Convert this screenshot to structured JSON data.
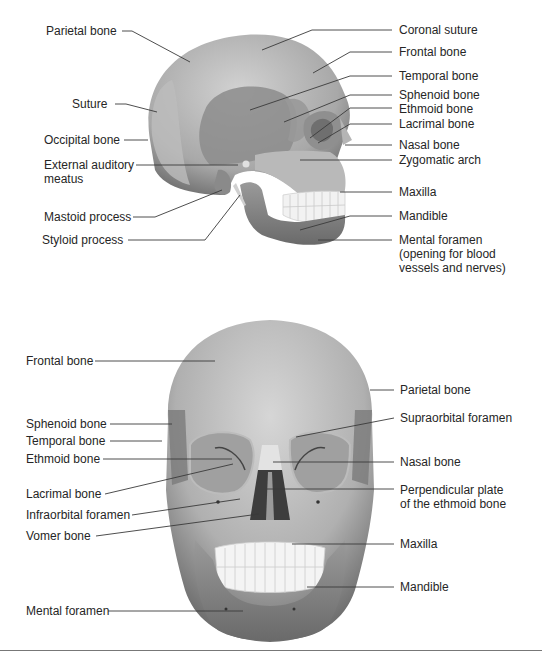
{
  "figure": {
    "lateral_view": {
      "left_labels": [
        {
          "id": "parietal",
          "text": "Parietal bone"
        },
        {
          "id": "suture",
          "text": "Suture"
        },
        {
          "id": "occipital",
          "text": "Occipital bone"
        },
        {
          "id": "ext_auditory",
          "text": "External auditory meatus",
          "line1": "External auditory",
          "line2": "meatus"
        },
        {
          "id": "mastoid",
          "text": "Mastoid process"
        },
        {
          "id": "styloid",
          "text": "Styloid process"
        }
      ],
      "right_labels": [
        {
          "id": "coronal",
          "text": "Coronal suture"
        },
        {
          "id": "frontal",
          "text": "Frontal bone"
        },
        {
          "id": "temporal",
          "text": "Temporal bone"
        },
        {
          "id": "sphenoid",
          "text": "Sphenoid bone"
        },
        {
          "id": "ethmoid",
          "text": "Ethmoid bone"
        },
        {
          "id": "lacrimal",
          "text": "Lacrimal bone"
        },
        {
          "id": "nasal",
          "text": "Nasal bone"
        },
        {
          "id": "zygomatic",
          "text": "Zygomatic arch"
        },
        {
          "id": "maxilla",
          "text": "Maxilla"
        },
        {
          "id": "mandible",
          "text": "Mandible"
        },
        {
          "id": "mental",
          "text": "Mental foramen (opening for blood vessels and nerves)",
          "line1": "Mental foramen",
          "line2": "(opening for blood",
          "line3": "vessels and nerves)"
        }
      ]
    },
    "anterior_view": {
      "left_labels": [
        {
          "id": "frontal",
          "text": "Frontal bone"
        },
        {
          "id": "sphenoid",
          "text": "Sphenoid bone"
        },
        {
          "id": "temporal",
          "text": "Temporal bone"
        },
        {
          "id": "ethmoid",
          "text": "Ethmoid bone"
        },
        {
          "id": "lacrimal",
          "text": "Lacrimal bone"
        },
        {
          "id": "infraorbital",
          "text": "Infraorbital foramen"
        },
        {
          "id": "vomer",
          "text": "Vomer bone"
        },
        {
          "id": "mental",
          "text": "Mental foramen"
        }
      ],
      "right_labels": [
        {
          "id": "parietal",
          "text": "Parietal bone"
        },
        {
          "id": "supraorbital",
          "text": "Supraorbital foramen"
        },
        {
          "id": "nasal",
          "text": "Nasal bone"
        },
        {
          "id": "perpendicular",
          "text": "Perpendicular plate of the ethmoid bone",
          "line1": "Perpendicular plate",
          "line2": "of the ethmoid bone"
        },
        {
          "id": "maxilla",
          "text": "Maxilla"
        },
        {
          "id": "mandible",
          "text": "Mandible"
        }
      ]
    },
    "colors": {
      "bone_light": "#c9c9c9",
      "bone_mid": "#a9a9a9",
      "bone_dark": "#7f7f7f",
      "teeth": "#f4f4f4",
      "leader_line": "#3a3a3a",
      "label_text": "#262626",
      "divider": "#777777"
    }
  }
}
